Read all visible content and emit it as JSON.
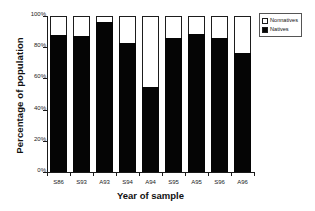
{
  "chart_data": {
    "type": "bar",
    "stacked": true,
    "title": "",
    "xlabel": "Year of sample",
    "ylabel": "Percentage of population",
    "categories": [
      "S86",
      "S93",
      "A93",
      "S94",
      "A94",
      "S95",
      "A95",
      "S96",
      "A96"
    ],
    "series": [
      {
        "name": "Natives",
        "color": "#050505",
        "values": [
          88,
          87,
          96,
          82.5,
          54.5,
          86,
          88.5,
          86,
          76
        ]
      },
      {
        "name": "Nonnatives",
        "color": "#ffffff",
        "values": [
          12,
          13,
          4,
          17.5,
          45.5,
          14,
          11.5,
          14,
          24
        ]
      }
    ],
    "ylim": [
      0,
      100
    ],
    "yticks": [
      "0%",
      "20%",
      "40%",
      "60%",
      "80%",
      "100%"
    ],
    "ytick_values": [
      0,
      20,
      40,
      60,
      80,
      100
    ],
    "grid": false,
    "legend_position": "right-top"
  },
  "legend": {
    "entries": [
      {
        "label": "Nonnatives",
        "swatch": "hollow"
      },
      {
        "label": "Natives",
        "swatch": "filled"
      }
    ]
  }
}
